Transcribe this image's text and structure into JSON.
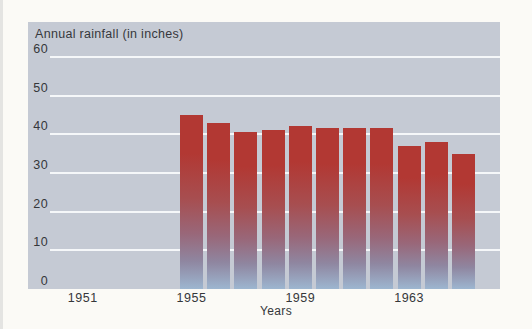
{
  "chart_data": {
    "type": "bar",
    "title": "Annual rainfall (in inches)",
    "x_axis_title": "Years",
    "y_axis_label_in_plot": "Annual rainfall (in inches)",
    "years": [
      1955,
      1956,
      1957,
      1958,
      1959,
      1960,
      1961,
      1962,
      1963,
      1964,
      1965
    ],
    "values": [
      45,
      43,
      40.5,
      41,
      42,
      41.5,
      41.5,
      41.5,
      37,
      38,
      35
    ],
    "x_tick_labels": [
      "1951",
      "1955",
      "1959",
      "1963"
    ],
    "x_ticks": [
      1951,
      1955,
      1959,
      1963
    ],
    "y_ticks": [
      0,
      10,
      20,
      30,
      40,
      50,
      60
    ],
    "ylim": [
      0,
      69
    ],
    "xlim_years": [
      1949,
      1966
    ],
    "legend": "none",
    "grid": "horizontal-white-lines",
    "colors": {
      "page_background": "#fbfaf6",
      "panel_background": "#c5cad4",
      "gridline": "#f5f7f9",
      "bar_top_red": "#b23833",
      "bar_bottom_blue": "#9db6d0",
      "text": "#35373a"
    }
  }
}
